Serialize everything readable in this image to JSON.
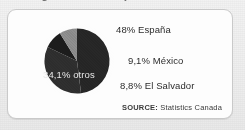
{
  "headline": {
    "text": "Origen de los hispanos en Canadá",
    "note": "cropped at top edge"
  },
  "card": {
    "background_color": "#fdfdfd",
    "border_color": "#c9c9c9"
  },
  "source": {
    "prefix": "SOURCE:",
    "name": "Statistics Canada"
  },
  "legend": {
    "espana": "48% España",
    "mexico": "9,1% México",
    "el_salvador": "8,8% El Salvador",
    "otros": "34,1% otros"
  },
  "chart_data": {
    "type": "pie",
    "title": "Origen de los hispanos en Canadá",
    "subtitle": "",
    "xlabel": "",
    "ylabel": "",
    "legend_position": "right",
    "grid": false,
    "labels": [
      "España",
      "otros",
      "México",
      "El Salvador"
    ],
    "values": [
      48,
      34.1,
      9.1,
      8.8
    ],
    "value_strings": [
      "48%",
      "34,1%",
      "9,1%",
      "8,8%"
    ],
    "data_labels": [
      "48% España",
      "34,1% otros",
      "9,1% México",
      "8,8% El Salvador"
    ],
    "colors": [
      "#262626",
      "#2e2e2e",
      "#1c1c1c",
      "#8c8c8c"
    ],
    "start_angle_deg": 0,
    "direction": "clockwise",
    "source": "SOURCE: Statistics Canada"
  }
}
